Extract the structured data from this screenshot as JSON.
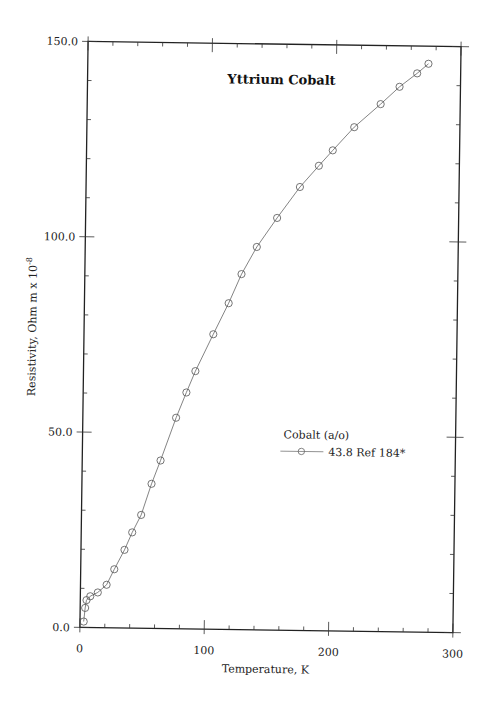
{
  "chart_data": {
    "type": "line",
    "title": "Yttrium Cobalt",
    "xlabel": "Temperature,  K",
    "ylabel": "Resistivity, Ohm m x 10",
    "ylabel_exponent": "-8",
    "xlim": [
      0,
      300
    ],
    "ylim": [
      0,
      150
    ],
    "x_ticks": [
      0,
      100,
      200,
      300
    ],
    "x_tick_labels": [
      "0",
      "100",
      "200",
      "300"
    ],
    "y_ticks": [
      0,
      50,
      100,
      150
    ],
    "y_tick_labels": [
      "0.0",
      "50.0",
      "100.0",
      "150.0"
    ],
    "x_minor_step": 20,
    "y_minor_step": 10,
    "grid": false,
    "legend": {
      "title": "Cobalt (a/o)",
      "position": "right-middle",
      "entries": [
        "43.8 Ref 184*"
      ]
    },
    "series": [
      {
        "name": "43.8 Ref 184*",
        "marker": "circle",
        "color": "#555555",
        "x": [
          3,
          4,
          5,
          8,
          14,
          21,
          27,
          35,
          41,
          48,
          56,
          63,
          75,
          83,
          90,
          104,
          116,
          126,
          138,
          154,
          172,
          187,
          198,
          215,
          236,
          251,
          265,
          274
        ],
        "y": [
          1.5,
          5,
          7,
          8,
          9,
          11,
          15,
          20,
          24.5,
          29,
          37,
          43,
          54,
          60.5,
          66,
          75.5,
          83.5,
          91,
          98,
          105.5,
          113.5,
          119,
          123,
          129,
          135,
          139.5,
          143,
          145.5
        ]
      }
    ]
  }
}
